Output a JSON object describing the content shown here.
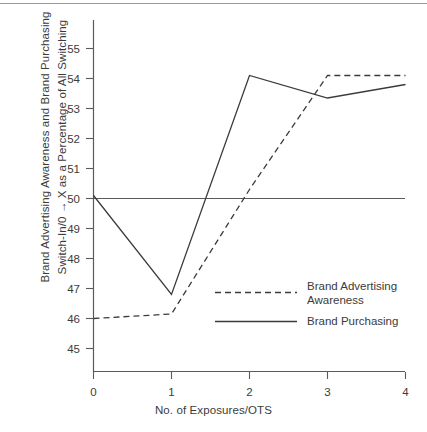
{
  "figure": {
    "ylabel_line1": "Brand Advertising Awareness and Brand Purchasing",
    "ylabel_line2": "Switch-In/0 → X as a Percentage of All Switching",
    "xlabel": "No. of Exposures/OTS"
  },
  "chart_data": {
    "type": "line",
    "title": "",
    "xlabel": "No. of Exposures/OTS",
    "ylabel": "Brand Advertising Awareness and Brand Purchasing Switch-In/0 → X as a Percentage of All Switching",
    "xlim": [
      0,
      4
    ],
    "ylim": [
      44.4,
      55.6
    ],
    "xticks": [
      "0",
      "1",
      "2",
      "3",
      "4"
    ],
    "yticks": [
      "45",
      "46",
      "47",
      "48",
      "49",
      "50",
      "51",
      "52",
      "53",
      "54",
      "55"
    ],
    "grid": false,
    "legend_position": "inside-right-lower",
    "reference_line": {
      "y": 50,
      "style": "solid",
      "label": ""
    },
    "x": [
      0,
      1,
      2,
      3,
      4
    ],
    "series": [
      {
        "name": "Brand Advertising Awareness",
        "style": "dashed",
        "color": "#3b3b3b",
        "values": [
          46.0,
          46.15,
          50.3,
          54.1,
          54.1
        ]
      },
      {
        "name": "Brand Purchasing",
        "style": "solid",
        "color": "#3b3b3b",
        "values": [
          50.1,
          46.8,
          54.1,
          53.35,
          53.8
        ]
      }
    ]
  },
  "legend": {
    "entries": [
      {
        "label_line1": "Brand Advertising",
        "label_line2": "Awareness",
        "style": "dashed"
      },
      {
        "label_line1": "Brand Purchasing",
        "label_line2": "",
        "style": "solid"
      }
    ]
  }
}
